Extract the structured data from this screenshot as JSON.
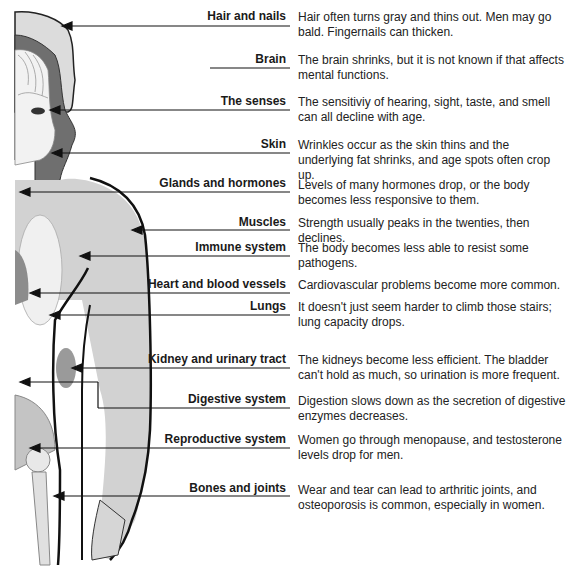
{
  "diagram": {
    "items": [
      {
        "label": "Hair and nails",
        "description": "Hair often turns gray and thins out. Men may go bald. Fingernails can thicken."
      },
      {
        "label": "Brain",
        "description": "The brain shrinks, but it is not known if that affects mental functions."
      },
      {
        "label": "The senses",
        "description": "The sensitiviy of hearing, sight, taste, and smell can all decline with age."
      },
      {
        "label": "Skin",
        "description": "Wrinkles occur as the skin thins and the underlying fat shrinks, and age spots often crop up."
      },
      {
        "label": "Glands and hormones",
        "description": "Levels of many hormones drop, or the body becomes less responsive to them."
      },
      {
        "label": "Muscles",
        "description": "Strength usually peaks in the twenties, then declines."
      },
      {
        "label": "Immune system",
        "description": "The body becomes less able to resist some pathogens."
      },
      {
        "label": "Heart and blood vessels",
        "description": "Cardiovascular problems become more common."
      },
      {
        "label": "Lungs",
        "description": "It doesn't just seem harder to climb those stairs; lung capacity drops."
      },
      {
        "label": "Kidney and urinary tract",
        "description": "The kidneys become less efficient. The bladder can't hold as much, so urination is more frequent."
      },
      {
        "label": "Digestive system",
        "description": "Digestion slows down as the secretion of digestive enzymes decreases."
      },
      {
        "label": "Reproductive system",
        "description": "Women go through menopause, and testosterone levels drop for men."
      },
      {
        "label": "Bones and joints",
        "description": "Wear and tear can lead to arthritic joints, and osteoporosis is common, especially in women."
      }
    ]
  },
  "colors": {
    "text": "#1a1a1a",
    "hair": "#d9d9d9",
    "dark_hair": "#6e6e6e",
    "body": "#cfcfcf",
    "outline": "#111111"
  }
}
